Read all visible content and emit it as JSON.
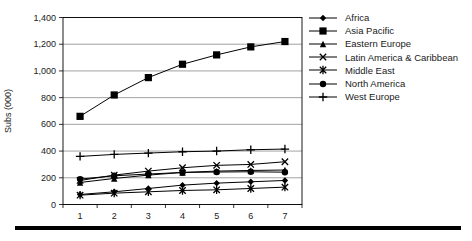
{
  "chart_data": {
    "type": "line",
    "title": "",
    "xlabel": "",
    "ylabel": "Subs (000)",
    "x": [
      "1",
      "2",
      "3",
      "4",
      "5",
      "6",
      "7"
    ],
    "ylim": [
      0,
      1400
    ],
    "ytick_step": 200,
    "ytick_labels": [
      "0",
      "200",
      "400",
      "600",
      "800",
      "1,000",
      "1,200",
      "1,400"
    ],
    "grid": true,
    "legend_position": "right",
    "line_color": "#000000",
    "gridline_color": "#8a8a8a",
    "series": [
      {
        "name": "Africa",
        "marker": "diamond",
        "values": [
          75,
          95,
          120,
          145,
          160,
          170,
          180
        ]
      },
      {
        "name": "Asia Pacific",
        "marker": "square",
        "values": [
          660,
          820,
          950,
          1050,
          1120,
          1180,
          1220
        ]
      },
      {
        "name": "Eastern Europe",
        "marker": "triangle",
        "values": [
          165,
          195,
          220,
          240,
          250,
          255,
          258
        ]
      },
      {
        "name": "Latin America & Caribbean",
        "marker": "x",
        "values": [
          180,
          220,
          250,
          275,
          293,
          300,
          320
        ]
      },
      {
        "name": "Middle East",
        "marker": "star",
        "values": [
          70,
          85,
          95,
          105,
          110,
          120,
          130
        ]
      },
      {
        "name": "North America",
        "marker": "circle",
        "values": [
          190,
          215,
          228,
          240,
          243,
          245,
          242
        ]
      },
      {
        "name": "West Europe",
        "marker": "plus",
        "values": [
          360,
          375,
          385,
          395,
          400,
          410,
          415
        ]
      }
    ]
  }
}
